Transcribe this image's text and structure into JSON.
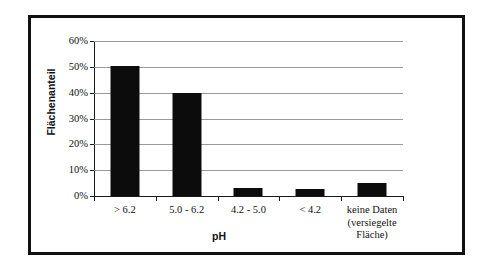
{
  "chart_data": {
    "type": "bar",
    "title": "",
    "subtitle": "",
    "xlabel": "pH",
    "ylabel": "Flächenanteil",
    "categories": [
      "> 6.2",
      "5.0 - 6.2",
      "4.2 - 5.0",
      "< 4.2",
      "keine Daten (versiegelte Fläche)"
    ],
    "category_lines": [
      [
        "> 6.2"
      ],
      [
        "5.0 - 6.2"
      ],
      [
        "4.2 - 5.0"
      ],
      [
        "< 4.2"
      ],
      [
        "keine Daten",
        "(versiegelte",
        "Fläche)"
      ]
    ],
    "values": [
      50.5,
      40.0,
      3.0,
      2.8,
      5.0
    ],
    "value_labels": [
      "50.5%",
      "40.0%",
      "3.0%",
      "2.8%",
      "5.0%"
    ],
    "ylim": [
      0,
      60
    ],
    "ytick_values": [
      0,
      10,
      20,
      30,
      40,
      50,
      60
    ],
    "ytick_labels": [
      "0%",
      "10%",
      "20%",
      "30%",
      "40%",
      "50%",
      "60%"
    ],
    "grid": true,
    "grid_axis": "y",
    "legend": false,
    "legend_position": "none",
    "bar_color": "#0c0c0c",
    "gridline_color": "#9a9a9a",
    "axis_color": "#1a1a1a",
    "frame_color": "#111111",
    "background_color": "#ffffff"
  }
}
